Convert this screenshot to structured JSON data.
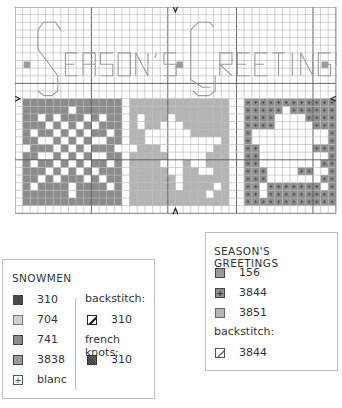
{
  "chart": {
    "title_letters": "SEASON'S GREETINGS",
    "grid": {
      "cols": 42,
      "rows": 27,
      "cell": 7.64,
      "line_color": "#b5b5b5",
      "heavy_color": "#555555",
      "heavy_cols": [
        10,
        20,
        29,
        39
      ],
      "heavy_rows": [
        10,
        20
      ]
    },
    "center_markers": {
      "top_arrow_col": 21,
      "bottom_arrow_col": 21,
      "left_arrow_row": 12,
      "right_arrow_row": 12
    },
    "colors": {
      "c310": "#4a4a4a",
      "c704": "#cfcfcf",
      "c741": "#8c8c8c",
      "c3838": "#9a9a9a",
      "c156": "#9c9c9c",
      "c3844": "#8f8f8f",
      "c3851": "#b4b4b4",
      "letters": "#9a9a9a"
    },
    "snowflake": {
      "col0": 1,
      "row0": 12,
      "w": 13,
      "h": 14,
      "white": [
        [
          6,
          1
        ],
        [
          2,
          2
        ],
        [
          4,
          2
        ],
        [
          8,
          2
        ],
        [
          10,
          2
        ],
        [
          3,
          3
        ],
        [
          5,
          3
        ],
        [
          7,
          3
        ],
        [
          9,
          3
        ],
        [
          1,
          4
        ],
        [
          4,
          4
        ],
        [
          6,
          4
        ],
        [
          8,
          4
        ],
        [
          11,
          4
        ],
        [
          2,
          5
        ],
        [
          3,
          5
        ],
        [
          5,
          5
        ],
        [
          7,
          5
        ],
        [
          9,
          5
        ],
        [
          10,
          5
        ],
        [
          0,
          6
        ],
        [
          4,
          6
        ],
        [
          6,
          6
        ],
        [
          8,
          6
        ],
        [
          12,
          6
        ],
        [
          2,
          7
        ],
        [
          3,
          7
        ],
        [
          5,
          7
        ],
        [
          7,
          7
        ],
        [
          9,
          7
        ],
        [
          10,
          7
        ],
        [
          1,
          8
        ],
        [
          4,
          8
        ],
        [
          6,
          8
        ],
        [
          8,
          8
        ],
        [
          11,
          8
        ],
        [
          3,
          9
        ],
        [
          5,
          9
        ],
        [
          7,
          9
        ],
        [
          9,
          9
        ],
        [
          2,
          10
        ],
        [
          4,
          10
        ],
        [
          8,
          10
        ],
        [
          10,
          10
        ],
        [
          1,
          11
        ],
        [
          6,
          11
        ],
        [
          11,
          11
        ],
        [
          6,
          12
        ]
      ]
    },
    "star": {
      "col0": 15,
      "row0": 12,
      "w": 13,
      "h": 14,
      "white": [
        [
          1,
          2
        ],
        [
          5,
          2
        ],
        [
          1,
          3
        ],
        [
          4,
          3
        ],
        [
          5,
          3
        ],
        [
          6,
          3
        ],
        [
          2,
          4
        ],
        [
          3,
          4
        ],
        [
          4,
          4
        ],
        [
          5,
          4
        ],
        [
          6,
          4
        ],
        [
          7,
          4
        ],
        [
          2,
          5
        ],
        [
          3,
          5
        ],
        [
          4,
          5
        ],
        [
          5,
          5
        ],
        [
          6,
          5
        ],
        [
          7,
          5
        ],
        [
          8,
          5
        ],
        [
          9,
          5
        ],
        [
          10,
          5
        ],
        [
          11,
          5
        ],
        [
          0,
          6
        ],
        [
          4,
          6
        ],
        [
          5,
          6
        ],
        [
          6,
          6
        ],
        [
          7,
          6
        ],
        [
          8,
          6
        ],
        [
          9,
          6
        ],
        [
          10,
          6
        ],
        [
          5,
          7
        ],
        [
          6,
          7
        ],
        [
          7,
          7
        ],
        [
          8,
          7
        ],
        [
          9,
          7
        ],
        [
          4,
          8
        ],
        [
          5,
          8
        ],
        [
          6,
          8
        ],
        [
          8,
          8
        ],
        [
          9,
          8
        ],
        [
          5,
          9
        ],
        [
          6,
          9
        ],
        [
          9,
          9
        ],
        [
          10,
          9
        ],
        [
          6,
          10
        ],
        [
          6,
          11
        ],
        [
          11,
          11
        ],
        [
          10,
          12
        ]
      ]
    },
    "dove": {
      "col0": 30,
      "row0": 12,
      "w": 12,
      "h": 14,
      "white": [
        [
          5,
          1
        ],
        [
          4,
          2
        ],
        [
          5,
          2
        ],
        [
          6,
          2
        ],
        [
          7,
          2
        ],
        [
          4,
          3
        ],
        [
          5,
          3
        ],
        [
          6,
          3
        ],
        [
          7,
          3
        ],
        [
          8,
          3
        ],
        [
          1,
          4
        ],
        [
          2,
          4
        ],
        [
          3,
          4
        ],
        [
          4,
          4
        ],
        [
          5,
          4
        ],
        [
          6,
          4
        ],
        [
          7,
          4
        ],
        [
          8,
          4
        ],
        [
          9,
          4
        ],
        [
          10,
          4
        ],
        [
          1,
          5
        ],
        [
          2,
          5
        ],
        [
          3,
          5
        ],
        [
          4,
          5
        ],
        [
          5,
          5
        ],
        [
          6,
          5
        ],
        [
          7,
          5
        ],
        [
          8,
          5
        ],
        [
          9,
          5
        ],
        [
          10,
          5
        ],
        [
          2,
          6
        ],
        [
          3,
          6
        ],
        [
          4,
          6
        ],
        [
          5,
          6
        ],
        [
          6,
          6
        ],
        [
          7,
          6
        ],
        [
          8,
          6
        ],
        [
          2,
          7
        ],
        [
          3,
          7
        ],
        [
          4,
          7
        ],
        [
          5,
          7
        ],
        [
          6,
          7
        ],
        [
          7,
          7
        ],
        [
          8,
          7
        ],
        [
          9,
          7
        ],
        [
          10,
          7
        ],
        [
          2,
          8
        ],
        [
          3,
          8
        ],
        [
          4,
          8
        ],
        [
          5,
          8
        ],
        [
          6,
          8
        ],
        [
          7,
          8
        ],
        [
          8,
          8
        ],
        [
          9,
          8
        ],
        [
          3,
          9
        ],
        [
          4,
          9
        ],
        [
          5,
          9
        ],
        [
          6,
          9
        ],
        [
          9,
          9
        ],
        [
          10,
          9
        ],
        [
          3,
          10
        ],
        [
          4,
          10
        ],
        [
          5,
          10
        ],
        [
          6,
          10
        ],
        [
          7,
          10
        ],
        [
          8,
          10
        ],
        [
          9,
          10
        ],
        [
          2,
          11
        ],
        [
          10,
          11
        ],
        [
          2,
          12
        ]
      ]
    }
  },
  "snowmen_legend": {
    "title": "SNOWMEN",
    "items": [
      {
        "code": "310",
        "swatch": "#4a4a4a",
        "symbol": ""
      },
      {
        "code": "704",
        "swatch": "#cfcfcf",
        "symbol": ""
      },
      {
        "code": "741",
        "swatch": "#8c8c8c",
        "symbol": ""
      },
      {
        "code": "3838",
        "swatch": "#9a9a9a",
        "symbol": ""
      },
      {
        "code": "blanc",
        "swatch": "#ffffff",
        "symbol": "+"
      }
    ],
    "backstitch_label": "backstitch:",
    "backstitch_code": "310",
    "french_knots_label": "french knots:",
    "french_knots_code": "310"
  },
  "greetings_legend": {
    "title": "SEASON'S GREETINGS",
    "items": [
      {
        "code": "156",
        "swatch": "#9c9c9c",
        "symbol": ""
      },
      {
        "code": "3844",
        "swatch": "#8f8f8f",
        "symbol": "+"
      },
      {
        "code": "3851",
        "swatch": "#b4b4b4",
        "symbol": ""
      }
    ],
    "backstitch_label": "backstitch:",
    "backstitch_code": "3844"
  }
}
